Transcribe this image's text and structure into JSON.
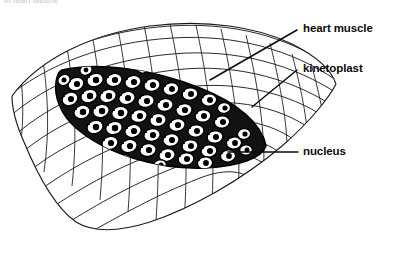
{
  "figure": {
    "type": "biological-line-drawing",
    "background_color": "#ffffff",
    "ink_color": "#000000",
    "caption_remnant": "in heart muscle"
  },
  "labels": [
    {
      "id": "heart-muscle",
      "text": "heart muscle",
      "x": 303,
      "y": 22,
      "leader": {
        "from": [
          297,
          30
        ],
        "to": [
          210,
          80
        ],
        "style": "diagonal"
      }
    },
    {
      "id": "kinetoplast",
      "text": "kinetoplast",
      "x": 303,
      "y": 62,
      "leader": {
        "from": [
          297,
          70
        ],
        "to": [
          252,
          107
        ],
        "style": "diagonal"
      }
    },
    {
      "id": "nucleus",
      "text": "nucleus",
      "x": 303,
      "y": 145,
      "leader": {
        "from": [
          298,
          152
        ],
        "to": [
          228,
          152
        ],
        "style": "horizontal"
      }
    }
  ],
  "structures": {
    "muscle_fiber": {
      "name": "heart muscle fiber",
      "description": "Elongated striated muscle fiber running lower-left to upper-right, drawn as longitudinal fibrils crossed by transverse striation lines",
      "fill": "#ffffff",
      "stroke": "#1a1a1a"
    },
    "pseudocyst": {
      "name": "pseudocyst",
      "description": "Dark lens-shaped intracellular cyst packed with amastigotes",
      "fill": "#141414",
      "stroke": "#000000"
    },
    "amastigote": {
      "name": "amastigote",
      "count": 68,
      "description": "Rounded parasite body with pale cytoplasm, dark nucleus and small dark kinetoplast",
      "cytoplasm_fill": "#ffffff",
      "nucleus_fill": "#000000",
      "kinetoplast_fill": "#000000"
    }
  }
}
